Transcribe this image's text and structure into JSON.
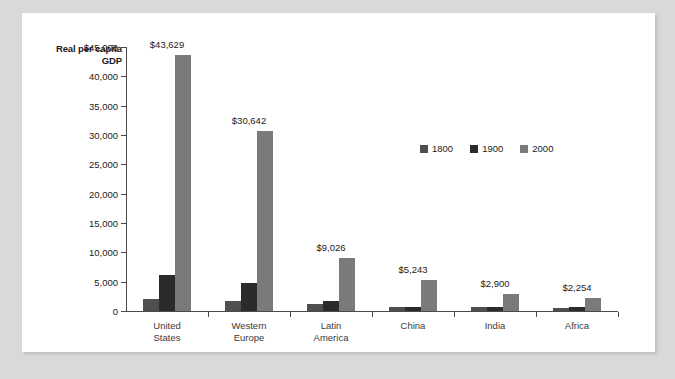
{
  "chart_data": {
    "type": "bar",
    "title": "",
    "ylabel": "Real per capita GDP",
    "xlabel": "",
    "ylim": [
      0,
      45000
    ],
    "grid": false,
    "legend_position": "inside-right",
    "categories": [
      "United\nStates",
      "Western\nEurope",
      "Latin\nAmerica",
      "China",
      "India",
      "Africa"
    ],
    "y_ticks": [
      "0",
      "5,000",
      "10,000",
      "15,000",
      "20,000",
      "25,000",
      "30,000",
      "35,000",
      "40,000",
      "$45,000"
    ],
    "y_tick_values": [
      0,
      5000,
      10000,
      15000,
      20000,
      25000,
      30000,
      35000,
      40000,
      45000
    ],
    "series": [
      {
        "name": "1800",
        "color": "#4f4f4f",
        "values": [
          1980,
          1750,
          1200,
          650,
          640,
          550
        ]
      },
      {
        "name": "1900",
        "color": "#2b2b2b",
        "values": [
          6150,
          4700,
          1700,
          620,
          650,
          640
        ]
      },
      {
        "name": "2000",
        "color": "#7a7a7a",
        "values": [
          43629,
          30642,
          9026,
          5243,
          2900,
          2254
        ]
      }
    ],
    "value_labels": [
      "$43,629",
      "$30,642",
      "$9,026",
      "$5,243",
      "$2,900",
      "$2,254"
    ]
  },
  "legend": {
    "items": [
      {
        "label": "1800",
        "color": "#4f4f4f"
      },
      {
        "label": "1900",
        "color": "#2b2b2b"
      },
      {
        "label": "2000",
        "color": "#7a7a7a"
      }
    ]
  },
  "colors": {
    "page_background": "#d9d9d9",
    "card_background": "#ffffff",
    "axis": "#4a4a4a",
    "text": "#1b1b1b"
  }
}
